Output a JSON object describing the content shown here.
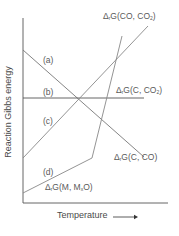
{
  "diagram": {
    "type": "Ellingham-style diagram",
    "axes": {
      "ylabel": "Reaction Gibbs energy",
      "xlabel": "Temperature",
      "x_arrow": "right-arrow"
    },
    "lines": [
      {
        "id": "a",
        "tag": "(a)",
        "label_prefix": "Δ",
        "label_sub": "r",
        "label_main": "G(C, CO)",
        "label_sub2": "",
        "label_close": "",
        "trend": "decreasing"
      },
      {
        "id": "b",
        "tag": "(b)",
        "label_prefix": "Δ",
        "label_sub": "r",
        "label_main": "G(C, CO",
        "label_sub2": "2",
        "label_close": ")",
        "trend": "flat"
      },
      {
        "id": "c",
        "tag": "(c)",
        "label_prefix": "Δ",
        "label_sub": "r",
        "label_main": "G(CO, CO",
        "label_sub2": "2",
        "label_close": ")",
        "trend": "increasing"
      },
      {
        "id": "d",
        "tag": "(d)",
        "label_prefix": "Δ",
        "label_sub": "r",
        "label_main": "G(M, M",
        "label_sub2": "x",
        "label_close": "O)",
        "trend": "increasing with kink"
      }
    ],
    "colors": {
      "axis": "#555555",
      "line": "#7a7a7a",
      "text": "#5a5a5a"
    }
  }
}
